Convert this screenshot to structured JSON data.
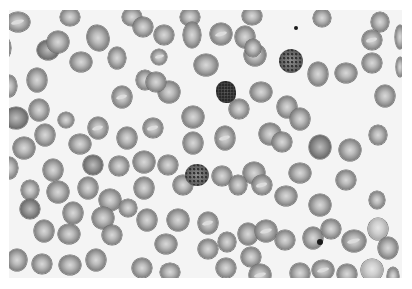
{
  "image": {
    "description": "Grayscale light micrograph of a peripheral blood smear showing red blood cells with central pallor, a few target/stippled cells and small dark inclusions",
    "background_color": "#f4f4f4",
    "frame": {
      "x": 9,
      "y": 10,
      "width": 393,
      "height": 268
    }
  },
  "cells": [
    {
      "x": 18,
      "y": 12,
      "rx": 12,
      "ry": 10,
      "rot": 0,
      "t": "rbc pale-stripe"
    },
    {
      "x": 70,
      "y": 7,
      "rx": 10,
      "ry": 9,
      "rot": 0,
      "t": "rbc"
    },
    {
      "x": 132,
      "y": 7,
      "rx": 10,
      "ry": 9,
      "rot": 0,
      "t": "rbc"
    },
    {
      "x": 190,
      "y": 7,
      "rx": 10,
      "ry": 9,
      "rot": 0,
      "t": "rbc"
    },
    {
      "x": 252,
      "y": 6,
      "rx": 10,
      "ry": 9,
      "rot": 0,
      "t": "rbc"
    },
    {
      "x": 322,
      "y": 8,
      "rx": 9,
      "ry": 9,
      "rot": 0,
      "t": "rbc"
    },
    {
      "x": 380,
      "y": 12,
      "rx": 9,
      "ry": 10,
      "rot": 0,
      "t": "rbc"
    },
    {
      "x": 3,
      "y": 38,
      "rx": 8,
      "ry": 12,
      "rot": 0,
      "t": "rbc"
    },
    {
      "x": 48,
      "y": 40,
      "rx": 11,
      "ry": 10,
      "rot": 0,
      "t": "rbc dark"
    },
    {
      "x": 58,
      "y": 32,
      "rx": 11,
      "ry": 11,
      "rot": 0,
      "t": "rbc"
    },
    {
      "x": 98,
      "y": 28,
      "rx": 11,
      "ry": 13,
      "rot": -15,
      "t": "rbc"
    },
    {
      "x": 81,
      "y": 52,
      "rx": 11,
      "ry": 10,
      "rot": 0,
      "t": "rbc"
    },
    {
      "x": 117,
      "y": 48,
      "rx": 9,
      "ry": 11,
      "rot": 0,
      "t": "rbc"
    },
    {
      "x": 143,
      "y": 17,
      "rx": 10,
      "ry": 10,
      "rot": 0,
      "t": "rbc"
    },
    {
      "x": 164,
      "y": 25,
      "rx": 10,
      "ry": 10,
      "rot": 0,
      "t": "rbc"
    },
    {
      "x": 159,
      "y": 47,
      "rx": 8,
      "ry": 8,
      "rot": 0,
      "t": "rbc pale-stripe"
    },
    {
      "x": 192,
      "y": 25,
      "rx": 9,
      "ry": 13,
      "rot": 0,
      "t": "rbc"
    },
    {
      "x": 206,
      "y": 55,
      "rx": 12,
      "ry": 11,
      "rot": 0,
      "t": "rbc"
    },
    {
      "x": 221,
      "y": 24,
      "rx": 11,
      "ry": 11,
      "rot": 0,
      "t": "rbc pale-stripe"
    },
    {
      "x": 245,
      "y": 27,
      "rx": 10,
      "ry": 11,
      "rot": 0,
      "t": "rbc"
    },
    {
      "x": 255,
      "y": 45,
      "rx": 11,
      "ry": 11,
      "rot": 0,
      "t": "rbc pale-stripe"
    },
    {
      "x": 253,
      "y": 38,
      "rx": 8,
      "ry": 9,
      "rot": 0,
      "t": "rbc"
    },
    {
      "x": 291,
      "y": 51,
      "rx": 12,
      "ry": 12,
      "rot": 0,
      "t": "stipple"
    },
    {
      "x": 318,
      "y": 64,
      "rx": 10,
      "ry": 12,
      "rot": 0,
      "t": "rbc"
    },
    {
      "x": 346,
      "y": 63,
      "rx": 11,
      "ry": 10,
      "rot": 0,
      "t": "rbc"
    },
    {
      "x": 372,
      "y": 53,
      "rx": 10,
      "ry": 10,
      "rot": 0,
      "t": "rbc"
    },
    {
      "x": 372,
      "y": 30,
      "rx": 10,
      "ry": 10,
      "rot": 0,
      "t": "rbc pale-stripe"
    },
    {
      "x": 400,
      "y": 27,
      "rx": 5,
      "ry": 12,
      "rot": 0,
      "t": "rbc"
    },
    {
      "x": 400,
      "y": 57,
      "rx": 4,
      "ry": 10,
      "rot": 0,
      "t": "rbc"
    },
    {
      "x": 9,
      "y": 76,
      "rx": 8,
      "ry": 11,
      "rot": 0,
      "t": "rbc"
    },
    {
      "x": 37,
      "y": 70,
      "rx": 10,
      "ry": 12,
      "rot": 0,
      "t": "rbc"
    },
    {
      "x": 39,
      "y": 100,
      "rx": 10,
      "ry": 11,
      "rot": 0,
      "t": "rbc"
    },
    {
      "x": 122,
      "y": 87,
      "rx": 10,
      "ry": 11,
      "rot": 0,
      "t": "rbc pale-stripe"
    },
    {
      "x": 145,
      "y": 70,
      "rx": 9,
      "ry": 10,
      "rot": 0,
      "t": "rbc"
    },
    {
      "x": 169,
      "y": 82,
      "rx": 11,
      "ry": 11,
      "rot": 0,
      "t": "rbc"
    },
    {
      "x": 156,
      "y": 72,
      "rx": 10,
      "ry": 10,
      "rot": 0,
      "t": "rbc"
    },
    {
      "x": 226,
      "y": 82,
      "rx": 10,
      "ry": 11,
      "rot": 0,
      "t": "lymph"
    },
    {
      "x": 261,
      "y": 82,
      "rx": 11,
      "ry": 10,
      "rot": 0,
      "t": "rbc"
    },
    {
      "x": 287,
      "y": 97,
      "rx": 10,
      "ry": 11,
      "rot": 0,
      "t": "rbc"
    },
    {
      "x": 239,
      "y": 99,
      "rx": 10,
      "ry": 10,
      "rot": 0,
      "t": "rbc"
    },
    {
      "x": 385,
      "y": 86,
      "rx": 10,
      "ry": 11,
      "rot": 0,
      "t": "rbc"
    },
    {
      "x": 16,
      "y": 108,
      "rx": 12,
      "ry": 11,
      "rot": 0,
      "t": "rbc dark"
    },
    {
      "x": 66,
      "y": 110,
      "rx": 8,
      "ry": 8,
      "rot": 0,
      "t": "rbc"
    },
    {
      "x": 98,
      "y": 118,
      "rx": 10,
      "ry": 11,
      "rot": 0,
      "t": "rbc pale-stripe"
    },
    {
      "x": 45,
      "y": 125,
      "rx": 10,
      "ry": 11,
      "rot": 0,
      "t": "rbc"
    },
    {
      "x": 80,
      "y": 134,
      "rx": 11,
      "ry": 10,
      "rot": 0,
      "t": "rbc"
    },
    {
      "x": 24,
      "y": 138,
      "rx": 11,
      "ry": 11,
      "rot": 0,
      "t": "rbc"
    },
    {
      "x": 127,
      "y": 128,
      "rx": 10,
      "ry": 11,
      "rot": 0,
      "t": "rbc"
    },
    {
      "x": 153,
      "y": 118,
      "rx": 10,
      "ry": 10,
      "rot": 0,
      "t": "rbc pale-stripe"
    },
    {
      "x": 193,
      "y": 107,
      "rx": 11,
      "ry": 11,
      "rot": 0,
      "t": "rbc"
    },
    {
      "x": 193,
      "y": 133,
      "rx": 10,
      "ry": 11,
      "rot": 0,
      "t": "rbc"
    },
    {
      "x": 225,
      "y": 128,
      "rx": 10,
      "ry": 12,
      "rot": 0,
      "t": "rbc pale-stripe"
    },
    {
      "x": 270,
      "y": 124,
      "rx": 11,
      "ry": 11,
      "rot": 0,
      "t": "rbc"
    },
    {
      "x": 282,
      "y": 132,
      "rx": 10,
      "ry": 10,
      "rot": 0,
      "t": "rbc"
    },
    {
      "x": 320,
      "y": 137,
      "rx": 11,
      "ry": 12,
      "rot": 0,
      "t": "rbc dark"
    },
    {
      "x": 300,
      "y": 109,
      "rx": 10,
      "ry": 11,
      "rot": 0,
      "t": "rbc"
    },
    {
      "x": 350,
      "y": 140,
      "rx": 11,
      "ry": 11,
      "rot": 0,
      "t": "rbc"
    },
    {
      "x": 378,
      "y": 125,
      "rx": 9,
      "ry": 10,
      "rot": 0,
      "t": "rbc"
    },
    {
      "x": 300,
      "y": 163,
      "rx": 11,
      "ry": 10,
      "rot": 0,
      "t": "rbc"
    },
    {
      "x": 346,
      "y": 170,
      "rx": 10,
      "ry": 10,
      "rot": 0,
      "t": "rbc"
    },
    {
      "x": 9,
      "y": 158,
      "rx": 9,
      "ry": 11,
      "rot": 0,
      "t": "rbc"
    },
    {
      "x": 53,
      "y": 160,
      "rx": 10,
      "ry": 11,
      "rot": 0,
      "t": "rbc"
    },
    {
      "x": 93,
      "y": 155,
      "rx": 10,
      "ry": 10,
      "rot": 0,
      "t": "rbc dark"
    },
    {
      "x": 119,
      "y": 156,
      "rx": 10,
      "ry": 10,
      "rot": 0,
      "t": "rbc"
    },
    {
      "x": 144,
      "y": 152,
      "rx": 11,
      "ry": 11,
      "rot": 0,
      "t": "rbc"
    },
    {
      "x": 144,
      "y": 178,
      "rx": 10,
      "ry": 11,
      "rot": 0,
      "t": "rbc"
    },
    {
      "x": 168,
      "y": 155,
      "rx": 10,
      "ry": 10,
      "rot": 0,
      "t": "rbc"
    },
    {
      "x": 183,
      "y": 175,
      "rx": 10,
      "ry": 10,
      "rot": 0,
      "t": "rbc"
    },
    {
      "x": 197,
      "y": 165,
      "rx": 12,
      "ry": 11,
      "rot": 0,
      "t": "stipple"
    },
    {
      "x": 222,
      "y": 166,
      "rx": 10,
      "ry": 10,
      "rot": 0,
      "t": "rbc"
    },
    {
      "x": 254,
      "y": 163,
      "rx": 11,
      "ry": 11,
      "rot": 0,
      "t": "rbc"
    },
    {
      "x": 262,
      "y": 175,
      "rx": 10,
      "ry": 10,
      "rot": 0,
      "t": "rbc pale-stripe"
    },
    {
      "x": 238,
      "y": 175,
      "rx": 9,
      "ry": 10,
      "rot": 0,
      "t": "rbc"
    },
    {
      "x": 286,
      "y": 186,
      "rx": 11,
      "ry": 10,
      "rot": 0,
      "t": "rbc"
    },
    {
      "x": 320,
      "y": 195,
      "rx": 11,
      "ry": 11,
      "rot": 0,
      "t": "rbc"
    },
    {
      "x": 377,
      "y": 190,
      "rx": 8,
      "ry": 9,
      "rot": 0,
      "t": "rbc"
    },
    {
      "x": 30,
      "y": 180,
      "rx": 9,
      "ry": 10,
      "rot": 0,
      "t": "rbc"
    },
    {
      "x": 58,
      "y": 182,
      "rx": 11,
      "ry": 11,
      "rot": 0,
      "t": "rbc"
    },
    {
      "x": 88,
      "y": 178,
      "rx": 10,
      "ry": 11,
      "rot": 0,
      "t": "rbc"
    },
    {
      "x": 110,
      "y": 190,
      "rx": 11,
      "ry": 11,
      "rot": 0,
      "t": "rbc"
    },
    {
      "x": 30,
      "y": 199,
      "rx": 10,
      "ry": 10,
      "rot": 0,
      "t": "rbc dark"
    },
    {
      "x": 73,
      "y": 203,
      "rx": 10,
      "ry": 11,
      "rot": 0,
      "t": "rbc"
    },
    {
      "x": 103,
      "y": 208,
      "rx": 11,
      "ry": 11,
      "rot": 0,
      "t": "rbc"
    },
    {
      "x": 44,
      "y": 221,
      "rx": 10,
      "ry": 11,
      "rot": 0,
      "t": "rbc"
    },
    {
      "x": 69,
      "y": 224,
      "rx": 11,
      "ry": 10,
      "rot": 0,
      "t": "rbc"
    },
    {
      "x": 112,
      "y": 225,
      "rx": 10,
      "ry": 10,
      "rot": 0,
      "t": "rbc"
    },
    {
      "x": 128,
      "y": 198,
      "rx": 9,
      "ry": 9,
      "rot": 0,
      "t": "rbc"
    },
    {
      "x": 147,
      "y": 210,
      "rx": 10,
      "ry": 11,
      "rot": 0,
      "t": "rbc"
    },
    {
      "x": 166,
      "y": 234,
      "rx": 11,
      "ry": 10,
      "rot": 0,
      "t": "rbc"
    },
    {
      "x": 178,
      "y": 210,
      "rx": 11,
      "ry": 11,
      "rot": 0,
      "t": "rbc"
    },
    {
      "x": 208,
      "y": 213,
      "rx": 10,
      "ry": 11,
      "rot": 0,
      "t": "rbc pale-stripe"
    },
    {
      "x": 208,
      "y": 239,
      "rx": 10,
      "ry": 10,
      "rot": 0,
      "t": "rbc"
    },
    {
      "x": 227,
      "y": 232,
      "rx": 9,
      "ry": 10,
      "rot": 0,
      "t": "rbc"
    },
    {
      "x": 248,
      "y": 224,
      "rx": 10,
      "ry": 11,
      "rot": 0,
      "t": "rbc"
    },
    {
      "x": 251,
      "y": 247,
      "rx": 10,
      "ry": 10,
      "rot": 0,
      "t": "rbc"
    },
    {
      "x": 266,
      "y": 221,
      "rx": 11,
      "ry": 11,
      "rot": 0,
      "t": "rbc pale-stripe"
    },
    {
      "x": 285,
      "y": 230,
      "rx": 10,
      "ry": 10,
      "rot": 0,
      "t": "rbc"
    },
    {
      "x": 313,
      "y": 228,
      "rx": 10,
      "ry": 11,
      "rot": 0,
      "t": "rbc"
    },
    {
      "x": 331,
      "y": 219,
      "rx": 10,
      "ry": 10,
      "rot": 0,
      "t": "rbc"
    },
    {
      "x": 354,
      "y": 231,
      "rx": 12,
      "ry": 11,
      "rot": 0,
      "t": "rbc pale-stripe"
    },
    {
      "x": 378,
      "y": 219,
      "rx": 10,
      "ry": 11,
      "rot": 0,
      "t": "light"
    },
    {
      "x": 388,
      "y": 238,
      "rx": 10,
      "ry": 11,
      "rot": 0,
      "t": "rbc"
    },
    {
      "x": 17,
      "y": 250,
      "rx": 10,
      "ry": 11,
      "rot": 0,
      "t": "rbc"
    },
    {
      "x": 42,
      "y": 254,
      "rx": 10,
      "ry": 10,
      "rot": 0,
      "t": "rbc"
    },
    {
      "x": 70,
      "y": 255,
      "rx": 11,
      "ry": 10,
      "rot": 0,
      "t": "rbc"
    },
    {
      "x": 96,
      "y": 250,
      "rx": 10,
      "ry": 11,
      "rot": 0,
      "t": "rbc"
    },
    {
      "x": 142,
      "y": 258,
      "rx": 10,
      "ry": 10,
      "rot": 0,
      "t": "rbc"
    },
    {
      "x": 170,
      "y": 262,
      "rx": 10,
      "ry": 9,
      "rot": 0,
      "t": "rbc"
    },
    {
      "x": 226,
      "y": 258,
      "rx": 10,
      "ry": 10,
      "rot": 0,
      "t": "rbc"
    },
    {
      "x": 260,
      "y": 265,
      "rx": 11,
      "ry": 11,
      "rot": 0,
      "t": "rbc pale-stripe"
    },
    {
      "x": 300,
      "y": 263,
      "rx": 10,
      "ry": 10,
      "rot": 0,
      "t": "rbc"
    },
    {
      "x": 323,
      "y": 260,
      "rx": 11,
      "ry": 10,
      "rot": 0,
      "t": "rbc pale-stripe"
    },
    {
      "x": 347,
      "y": 264,
      "rx": 10,
      "ry": 10,
      "rot": 0,
      "t": "rbc"
    },
    {
      "x": 372,
      "y": 260,
      "rx": 11,
      "ry": 11,
      "rot": 0,
      "t": "light"
    },
    {
      "x": 393,
      "y": 266,
      "rx": 6,
      "ry": 9,
      "rot": 0,
      "t": "rbc"
    }
  ],
  "dots": [
    {
      "x": 296,
      "y": 28,
      "r": 2
    },
    {
      "x": 320,
      "y": 242,
      "r": 3
    }
  ]
}
